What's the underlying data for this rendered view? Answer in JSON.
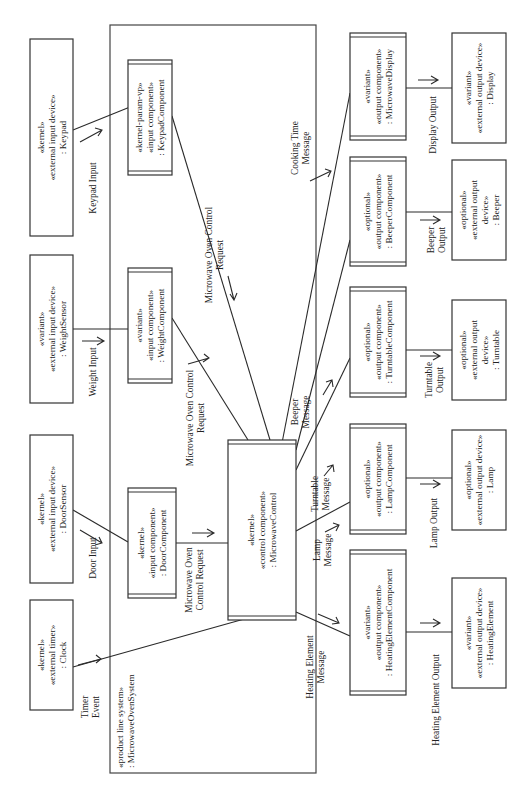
{
  "diagram": {
    "system": {
      "stereotype": "«product line system»",
      "name": ": MicrowaveOvenSystem"
    },
    "external_inputs": [
      {
        "id": "keypad",
        "lines": [
          "«kernel»",
          "«external input device»",
          ": Keypad"
        ]
      },
      {
        "id": "weight-sensor",
        "lines": [
          "«variant»",
          "«external input device»",
          ": WeightSensor"
        ]
      },
      {
        "id": "door-sensor",
        "lines": [
          "«kernel»",
          "«external input device»",
          ": DoorSensor"
        ]
      },
      {
        "id": "clock",
        "lines": [
          "«kernel»",
          "«external timer»",
          ": Clock"
        ]
      }
    ],
    "input_components": [
      {
        "id": "keypad-component",
        "lines": [
          "«kernel-param-vp»",
          "«input component»",
          ": KeypadComponent"
        ]
      },
      {
        "id": "weight-component",
        "lines": [
          "«variant»",
          "«input component»",
          ": WeightComponent"
        ]
      },
      {
        "id": "door-component",
        "lines": [
          "«kernel»",
          "«input component»",
          ": DoorComponent"
        ]
      }
    ],
    "control_component": {
      "id": "microwave-control",
      "lines": [
        "«kernel»",
        "«control component»",
        ": MicrowaveControl"
      ]
    },
    "output_components": [
      {
        "id": "microwave-display",
        "lines": [
          "«variant»",
          "«output component»",
          ": MicrowaveDisplay"
        ]
      },
      {
        "id": "beeper-component",
        "lines": [
          "«optional»",
          "«output component»",
          ": BeeperComponent"
        ]
      },
      {
        "id": "turntable-component",
        "lines": [
          "«optional»",
          "«output component»",
          ": TurntableComponent"
        ]
      },
      {
        "id": "lamp-component",
        "lines": [
          "«optional»",
          "«output component»",
          ": LampComponent"
        ]
      },
      {
        "id": "heating-element-component",
        "lines": [
          "«variant»",
          "«output component»",
          ": HeatingElementComponent"
        ]
      }
    ],
    "external_outputs": [
      {
        "id": "display",
        "lines": [
          "«variant»",
          "«external output device»",
          ": Display"
        ]
      },
      {
        "id": "beeper",
        "lines": [
          "«optional»",
          "«external output",
          "device»",
          ": Beeper"
        ]
      },
      {
        "id": "turntable",
        "lines": [
          "«optional»",
          "«external output",
          "device»",
          ": Turntable"
        ]
      },
      {
        "id": "lamp",
        "lines": [
          "«optional»",
          "«external output device»",
          ": Lamp"
        ]
      },
      {
        "id": "heating-element",
        "lines": [
          "«variant»",
          "«external output device»",
          ": HeatingElement"
        ]
      }
    ],
    "messages": {
      "keypad_input": [
        "Keypad Input"
      ],
      "weight_input": [
        "Weight Input"
      ],
      "door_input": [
        "Door Input"
      ],
      "timer_event": [
        "Timer",
        "Event"
      ],
      "keypad_request": [
        "Microwave Oven Control",
        "Request"
      ],
      "weight_request": [
        "Microwave Oven Control",
        "Request"
      ],
      "door_request": [
        "Microwave Oven",
        "Control Request"
      ],
      "cooking_time": [
        "Cooking Time",
        "Message"
      ],
      "beeper_msg": [
        "Beeper",
        "Message"
      ],
      "turntable_msg": [
        "Turntable",
        "Message"
      ],
      "lamp_msg": [
        "Lamp",
        "Message"
      ],
      "heating_msg": [
        "Heating Element",
        "Message"
      ],
      "display_output": [
        "Display Output"
      ],
      "beeper_output": [
        "Beeper",
        "Output"
      ],
      "turntable_output": [
        "Turntable",
        "Output"
      ],
      "lamp_output": [
        "Lamp Output"
      ],
      "heating_output": [
        "Heating Element Output"
      ]
    }
  }
}
